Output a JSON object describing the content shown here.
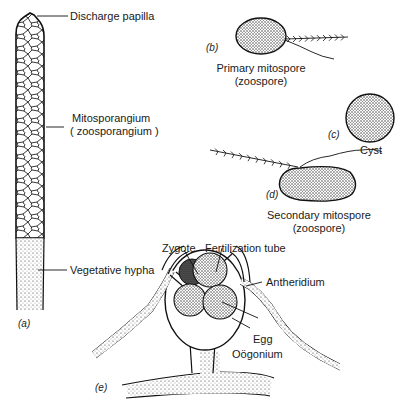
{
  "figure": {
    "panels": [
      {
        "id": "a",
        "tag": "(a)"
      },
      {
        "id": "b",
        "tag": "(b)"
      },
      {
        "id": "c",
        "tag": "(c)"
      },
      {
        "id": "d",
        "tag": "(d)"
      },
      {
        "id": "e",
        "tag": "(e)"
      }
    ],
    "labels": {
      "discharge_papilla": "Discharge papilla",
      "mitosporangium": "Mitosporangium",
      "zoosporangium": "( zoosporangium )",
      "vegetative_hypha": "Vegetative hypha",
      "primary_mitospore": "Primary mitospore",
      "primary_zoospore": "(zoospore)",
      "cyst": "Cyst",
      "secondary_mitospore": "Secondary mitospore",
      "secondary_zoospore": "(zoospore)",
      "zygote": "Zygote",
      "fertilization_tube": "Fertilization tube",
      "antheridium": "Antheridium",
      "egg": "Egg",
      "oogonium": "Oögonium"
    }
  }
}
